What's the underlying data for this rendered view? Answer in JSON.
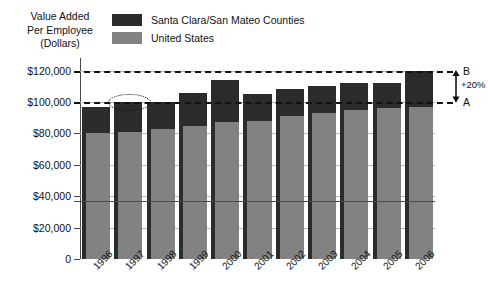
{
  "axis_title": {
    "line1": "Value Added",
    "line2": "Per Employee",
    "line3": "(Dollars)"
  },
  "legend": {
    "items": [
      {
        "label": "Santa Clara/San Mateo Counties",
        "color": "#2b2b2b"
      },
      {
        "label": "United States",
        "color": "#828282"
      }
    ]
  },
  "annotations": {
    "upper_label": "B",
    "lower_label": "A",
    "delta_label": "+20%",
    "upper_value": 120000,
    "lower_value": 100000,
    "highlight_year": "1997"
  },
  "chart_data": {
    "type": "bar",
    "title": "Value Added Per Employee (Dollars)",
    "xlabel": "",
    "ylabel": "Value Added Per Employee (Dollars)",
    "ylim": [
      0,
      128000
    ],
    "grid": true,
    "legend_position": "top",
    "ytick_labels": [
      "$120,000",
      "$100,000",
      "$80,000",
      "$60,000",
      "$40,000",
      "$20,000",
      "0"
    ],
    "ytick_values": [
      120000,
      100000,
      80000,
      60000,
      40000,
      20000,
      0
    ],
    "categories": [
      "1996",
      "1997",
      "1998",
      "1999",
      "2000",
      "2001",
      "2002",
      "2003",
      "2004",
      "2005",
      "2006"
    ],
    "series": [
      {
        "name": "Santa Clara/San Mateo Counties",
        "color": "#2b2b2b",
        "values": [
          97000,
          100000,
          100000,
          106000,
          114000,
          105000,
          108000,
          110000,
          112000,
          112000,
          120000
        ]
      },
      {
        "name": "United States",
        "color": "#828282",
        "values": [
          80000,
          81000,
          83000,
          85000,
          87000,
          88000,
          91000,
          93000,
          95000,
          96000,
          97000
        ]
      }
    ]
  }
}
